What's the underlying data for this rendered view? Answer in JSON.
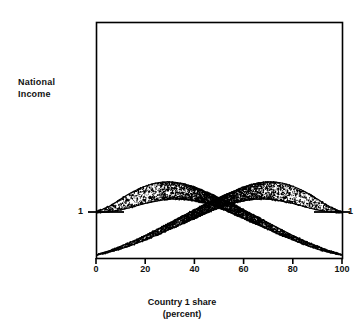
{
  "chart_data": {
    "type": "scatter",
    "title": "",
    "xlabel": "Country 1 share\n(percent)",
    "xlabel_line1": "Country 1 share",
    "xlabel_line2": "(percent)",
    "ylabel": "National\nIncome",
    "ylabel_line1": "National",
    "ylabel_line2": "Income",
    "xlim": [
      0,
      100
    ],
    "xticks": [
      0,
      20,
      40,
      60,
      80,
      100
    ],
    "xticklabels": [
      "0",
      "20",
      "40",
      "60",
      "80",
      "100"
    ],
    "yticks": [
      1
    ],
    "yticklabels": [
      "1"
    ],
    "ytick_label_left": "1",
    "ytick_label_right": "1",
    "grid": false,
    "legend": null,
    "frame": "full-box",
    "series": [
      {
        "name": "Country 1 national income",
        "description": "Upper band: starts at level 1 at 0 percent share, rises to a hump peaking near 27 percent, then declines monotonically to zero at 100 percent.",
        "envelope_upper": [
          {
            "x": 0,
            "y": 1.0
          },
          {
            "x": 5,
            "y": 1.12
          },
          {
            "x": 10,
            "y": 1.3
          },
          {
            "x": 15,
            "y": 1.47
          },
          {
            "x": 20,
            "y": 1.6
          },
          {
            "x": 25,
            "y": 1.68
          },
          {
            "x": 30,
            "y": 1.7
          },
          {
            "x": 35,
            "y": 1.66
          },
          {
            "x": 40,
            "y": 1.58
          },
          {
            "x": 45,
            "y": 1.46
          },
          {
            "x": 50,
            "y": 1.33
          },
          {
            "x": 55,
            "y": 1.2
          },
          {
            "x": 60,
            "y": 1.05
          },
          {
            "x": 65,
            "y": 0.9
          },
          {
            "x": 70,
            "y": 0.75
          },
          {
            "x": 75,
            "y": 0.6
          },
          {
            "x": 80,
            "y": 0.45
          },
          {
            "x": 85,
            "y": 0.32
          },
          {
            "x": 90,
            "y": 0.2
          },
          {
            "x": 95,
            "y": 0.09
          },
          {
            "x": 100,
            "y": 0.0
          }
        ],
        "envelope_lower": [
          {
            "x": 0,
            "y": 0.98
          },
          {
            "x": 5,
            "y": 1.0
          },
          {
            "x": 10,
            "y": 1.05
          },
          {
            "x": 15,
            "y": 1.12
          },
          {
            "x": 20,
            "y": 1.2
          },
          {
            "x": 25,
            "y": 1.26
          },
          {
            "x": 30,
            "y": 1.3
          },
          {
            "x": 35,
            "y": 1.3
          },
          {
            "x": 40,
            "y": 1.26
          },
          {
            "x": 45,
            "y": 1.2
          },
          {
            "x": 50,
            "y": 1.1
          },
          {
            "x": 55,
            "y": 0.98
          },
          {
            "x": 60,
            "y": 0.85
          },
          {
            "x": 65,
            "y": 0.72
          },
          {
            "x": 70,
            "y": 0.6
          },
          {
            "x": 75,
            "y": 0.47
          },
          {
            "x": 80,
            "y": 0.35
          },
          {
            "x": 85,
            "y": 0.24
          },
          {
            "x": 90,
            "y": 0.14
          },
          {
            "x": 95,
            "y": 0.06
          },
          {
            "x": 100,
            "y": 0.0
          }
        ]
      },
      {
        "name": "Country 2 national income",
        "description": "Lower band: mirror image of the upper band about 50 percent share. Starts at zero at 0 percent, rises to a hump peaking near 73 percent, and reaches level 1 at 100 percent.",
        "envelope_upper": [
          {
            "x": 0,
            "y": 0.0
          },
          {
            "x": 5,
            "y": 0.09
          },
          {
            "x": 10,
            "y": 0.2
          },
          {
            "x": 15,
            "y": 0.32
          },
          {
            "x": 20,
            "y": 0.45
          },
          {
            "x": 25,
            "y": 0.6
          },
          {
            "x": 30,
            "y": 0.75
          },
          {
            "x": 35,
            "y": 0.9
          },
          {
            "x": 40,
            "y": 1.05
          },
          {
            "x": 45,
            "y": 1.2
          },
          {
            "x": 50,
            "y": 1.33
          },
          {
            "x": 55,
            "y": 1.46
          },
          {
            "x": 60,
            "y": 1.58
          },
          {
            "x": 65,
            "y": 1.66
          },
          {
            "x": 70,
            "y": 1.7
          },
          {
            "x": 75,
            "y": 1.68
          },
          {
            "x": 80,
            "y": 1.6
          },
          {
            "x": 85,
            "y": 1.47
          },
          {
            "x": 90,
            "y": 1.3
          },
          {
            "x": 95,
            "y": 1.12
          },
          {
            "x": 100,
            "y": 1.0
          }
        ],
        "envelope_lower": [
          {
            "x": 0,
            "y": 0.0
          },
          {
            "x": 5,
            "y": 0.06
          },
          {
            "x": 10,
            "y": 0.14
          },
          {
            "x": 15,
            "y": 0.24
          },
          {
            "x": 20,
            "y": 0.35
          },
          {
            "x": 25,
            "y": 0.47
          },
          {
            "x": 30,
            "y": 0.6
          },
          {
            "x": 35,
            "y": 0.72
          },
          {
            "x": 40,
            "y": 0.85
          },
          {
            "x": 45,
            "y": 0.98
          },
          {
            "x": 50,
            "y": 1.1
          },
          {
            "x": 55,
            "y": 1.2
          },
          {
            "x": 60,
            "y": 1.26
          },
          {
            "x": 65,
            "y": 1.3
          },
          {
            "x": 70,
            "y": 1.3
          },
          {
            "x": 75,
            "y": 1.26
          },
          {
            "x": 80,
            "y": 1.2
          },
          {
            "x": 85,
            "y": 1.12
          },
          {
            "x": 90,
            "y": 1.05
          },
          {
            "x": 95,
            "y": 1.0
          },
          {
            "x": 100,
            "y": 0.98
          }
        ]
      }
    ],
    "point_color": "#000000",
    "line_color": "#000000",
    "frame_color": "#000000",
    "background": "#ffffff"
  }
}
